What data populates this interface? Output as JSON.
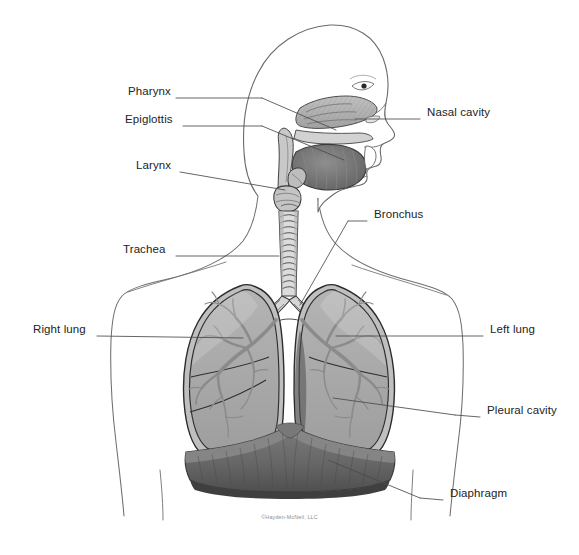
{
  "figure": {
    "background_color": "#ffffff",
    "width": 579,
    "height": 555
  },
  "credit": {
    "text": "©Hayden-McNeil, LLC"
  },
  "palette": {
    "outline": "#5a5a5a",
    "body_outline": "#6b6b6b",
    "organ_outline": "#2e2e2e",
    "lung_fill": "#a9a9a9",
    "lung_fill_light": "#b6b6b6",
    "bronchial_tree": "#8a8a8a",
    "diaphragm_fill": "#6f6f6f",
    "diaphragm_dark": "#575757",
    "trachea_fill": "#d8d8d8",
    "tongue_fill": "#707070",
    "nasal_fill": "#b0b0b0",
    "label_text": "#232323",
    "leader_line": "#4a4a4a",
    "credit_text": "#8f8f8f"
  },
  "labels": [
    {
      "id": "pharynx",
      "text": "Pharynx",
      "side": "left",
      "x": 128,
      "y": 92,
      "leader_from": [
        176,
        98
      ],
      "leader_to": [
        330,
        128
      ]
    },
    {
      "id": "epiglottis",
      "text": "Epiglottis",
      "side": "left",
      "x": 125,
      "y": 120,
      "leader_from": [
        183,
        126
      ],
      "leader_to": [
        335,
        166
      ]
    },
    {
      "id": "larynx",
      "text": "Larynx",
      "side": "left",
      "x": 136,
      "y": 166,
      "leader_from": [
        180,
        172
      ],
      "leader_to": [
        318,
        187
      ]
    },
    {
      "id": "trachea",
      "text": "Trachea",
      "side": "left",
      "x": 123,
      "y": 250,
      "leader_from": [
        176,
        256
      ],
      "leader_to": [
        277,
        256
      ]
    },
    {
      "id": "right-lung",
      "text": "Right lung",
      "side": "left",
      "x": 33,
      "y": 330,
      "leader_from": [
        97,
        336
      ],
      "leader_to": [
        243,
        338
      ]
    },
    {
      "id": "nasal-cavity",
      "text": "Nasal cavity",
      "side": "right",
      "x": 427,
      "y": 113,
      "leader_from": [
        420,
        119
      ],
      "leader_to": [
        355,
        120
      ]
    },
    {
      "id": "bronchus",
      "text": "Bronchus",
      "side": "right",
      "x": 374,
      "y": 215,
      "leader_from": [
        367,
        221
      ],
      "leader_to": [
        332,
        212
      ]
    },
    {
      "id": "left-lung",
      "text": "Left lung",
      "side": "right",
      "x": 490,
      "y": 330,
      "leader_from": [
        483,
        336
      ],
      "leader_to": [
        336,
        336
      ]
    },
    {
      "id": "pleural-cavity",
      "text": "Pleural cavity",
      "side": "right",
      "x": 487,
      "y": 411,
      "leader_from": [
        480,
        417
      ],
      "leader_to": [
        333,
        401
      ]
    },
    {
      "id": "diaphragm",
      "text": "Diaphragm",
      "side": "right",
      "x": 450,
      "y": 494,
      "leader_from": [
        443,
        500
      ],
      "leader_to": [
        330,
        461
      ]
    }
  ],
  "structures": [
    {
      "id": "head-profile",
      "name": "head-and-neck-profile"
    },
    {
      "id": "torso-outline",
      "name": "torso-outline"
    },
    {
      "id": "nasal-cavity",
      "name": "nasal-cavity"
    },
    {
      "id": "tongue",
      "name": "tongue"
    },
    {
      "id": "pharynx",
      "name": "pharynx"
    },
    {
      "id": "epiglottis",
      "name": "epiglottis"
    },
    {
      "id": "larynx",
      "name": "larynx"
    },
    {
      "id": "trachea",
      "name": "trachea"
    },
    {
      "id": "bronchus-left",
      "name": "left-primary-bronchus"
    },
    {
      "id": "bronchus-right",
      "name": "right-primary-bronchus"
    },
    {
      "id": "lung-right",
      "name": "right-lung"
    },
    {
      "id": "lung-left",
      "name": "left-lung"
    },
    {
      "id": "diaphragm",
      "name": "diaphragm"
    },
    {
      "id": "pleural-cavity",
      "name": "pleural-cavity"
    }
  ]
}
